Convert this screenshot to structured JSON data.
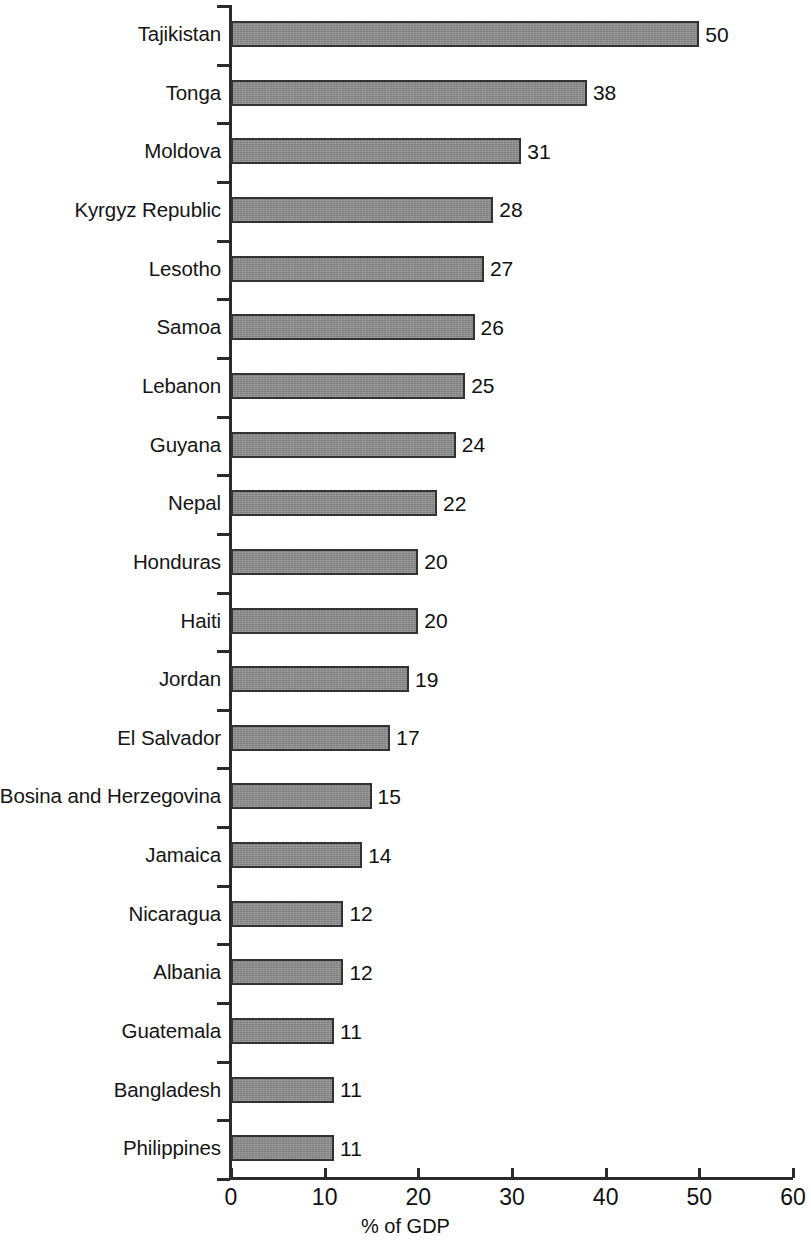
{
  "chart_data": {
    "type": "bar",
    "orientation": "horizontal",
    "title": "",
    "subtitle": "",
    "xlabel": "% of GDP",
    "ylabel": "",
    "xlim": [
      0,
      60
    ],
    "x_ticks": [
      0,
      10,
      20,
      30,
      40,
      50,
      60
    ],
    "x_tick_labels": [
      "0",
      "10",
      "20",
      "30",
      "40",
      "50",
      "60"
    ],
    "grid": false,
    "legend": null,
    "bar_color": "#8c8c8c",
    "bar_edge_color": "#333333",
    "axis_color": "#2b2b2b",
    "categories": [
      "Tajikistan",
      "Tonga",
      "Moldova",
      "Kyrgyz Republic",
      "Lesotho",
      "Samoa",
      "Lebanon",
      "Guyana",
      "Nepal",
      "Honduras",
      "Haiti",
      "Jordan",
      "El Salvador",
      "Bosina and Herzegovina",
      "Jamaica",
      "Nicaragua",
      "Albania",
      "Guatemala",
      "Bangladesh",
      "Philippines"
    ],
    "values": [
      50,
      38,
      31,
      28,
      27,
      26,
      25,
      24,
      22,
      20,
      20,
      19,
      17,
      15,
      14,
      12,
      12,
      11,
      11,
      11
    ],
    "value_labels": [
      "50",
      "38",
      "31",
      "28",
      "27",
      "26",
      "25",
      "24",
      "22",
      "20",
      "20",
      "19",
      "17",
      "15",
      "14",
      "12",
      "12",
      "11",
      "11",
      "11"
    ]
  }
}
